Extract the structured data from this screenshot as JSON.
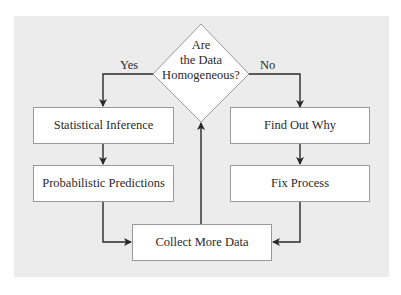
{
  "diagram": {
    "type": "flowchart",
    "decision": {
      "lines": [
        "Are",
        "the Data",
        "Homogeneous?"
      ]
    },
    "branches": {
      "yes_label": "Yes",
      "no_label": "No"
    },
    "nodes": {
      "statistical_inference": "Statistical Inference",
      "probabilistic_predictions": "Probabilistic Predictions",
      "find_out_why": "Find Out Why",
      "fix_process": "Fix Process",
      "collect_more_data": "Collect More Data"
    },
    "edges": [
      {
        "from": "decision",
        "to": "statistical_inference",
        "label": "Yes"
      },
      {
        "from": "decision",
        "to": "find_out_why",
        "label": "No"
      },
      {
        "from": "statistical_inference",
        "to": "probabilistic_predictions"
      },
      {
        "from": "find_out_why",
        "to": "fix_process"
      },
      {
        "from": "probabilistic_predictions",
        "to": "collect_more_data"
      },
      {
        "from": "fix_process",
        "to": "collect_more_data"
      },
      {
        "from": "collect_more_data",
        "to": "decision"
      }
    ],
    "colors": {
      "panel": "#ececec",
      "box_fill": "#ffffff",
      "box_border": "#9a9a9a",
      "line": "#2a2a2a"
    }
  }
}
